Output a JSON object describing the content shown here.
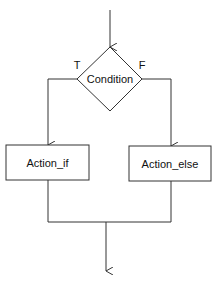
{
  "diagram": {
    "type": "flowchart",
    "title": "",
    "colors": {
      "stroke": "#333333",
      "text": "#111111",
      "background": "#ffffff"
    },
    "nodes": {
      "condition": {
        "label": "Condition",
        "shape": "diamond"
      },
      "action_if": {
        "label": "Action_if",
        "shape": "rectangle"
      },
      "action_else": {
        "label": "Action_else",
        "shape": "rectangle"
      }
    },
    "edges": {
      "true_label": "T",
      "false_label": "F"
    }
  }
}
